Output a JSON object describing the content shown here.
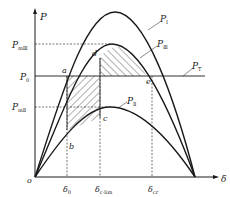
{
  "diagram": {
    "axes": {
      "y_label": "P",
      "x_label": "δ",
      "origin_label": "o"
    },
    "curves": [
      {
        "id": "P_I",
        "label": "P",
        "subscript": "I"
      },
      {
        "id": "P_III",
        "label": "P",
        "subscript": "Ⅲ"
      },
      {
        "id": "P_II",
        "label": "P",
        "subscript": "Ⅱ"
      },
      {
        "id": "P_T",
        "label": "P",
        "subscript": "T"
      }
    ],
    "y_ticks": [
      {
        "label": "P",
        "subscript": "mⅢ"
      },
      {
        "label": "P",
        "subscript": "0"
      },
      {
        "label": "P",
        "subscript": "mⅡ"
      }
    ],
    "x_ticks": [
      {
        "label": "δ",
        "subscript": "0"
      },
      {
        "label": "δ",
        "subscript": "c·lim"
      },
      {
        "label": "δ",
        "subscript": "cr"
      }
    ],
    "points": [
      "a",
      "b",
      "c",
      "d",
      "e"
    ],
    "colors": {
      "line": "#1a1a1a",
      "background": "#ffffff"
    }
  }
}
